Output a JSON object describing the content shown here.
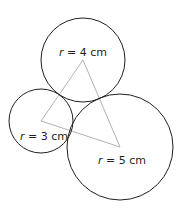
{
  "diagram": {
    "circles": [
      {
        "id": "top",
        "cx": 83,
        "cy": 60,
        "r": 42,
        "label_var": "r",
        "label_rest": " = 4 cm",
        "lx": 83,
        "ly": 56
      },
      {
        "id": "left",
        "cx": 41,
        "cy": 121,
        "r": 32,
        "label_var": "r",
        "label_rest": " = 3 cm",
        "lx": 44,
        "ly": 140
      },
      {
        "id": "right",
        "cx": 120,
        "cy": 147,
        "r": 53,
        "label_var": "r",
        "label_rest": " = 5 cm",
        "lx": 122,
        "ly": 164
      }
    ],
    "triangle": {
      "points": "83,60 41,121 120,147",
      "color": "#b3b3b3"
    },
    "circle_color": "#231f20"
  }
}
